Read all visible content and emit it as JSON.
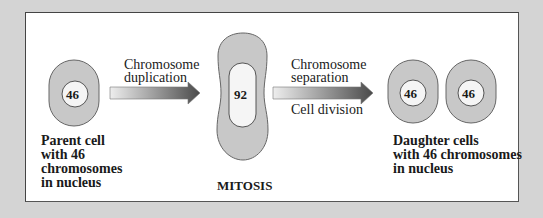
{
  "diagram": {
    "title": "MITOSIS",
    "parent_cell": {
      "chromosome_count": "46",
      "caption": [
        "Parent cell",
        "with 46",
        "chromosomes",
        "in nucleus"
      ]
    },
    "step1": {
      "label": [
        "Chromosome",
        "duplication"
      ]
    },
    "mitosis_cell": {
      "chromosome_count": "92",
      "label": "MITOSIS"
    },
    "step2": {
      "label_above": [
        "Chromosome",
        "separation"
      ],
      "label_below": "Cell division"
    },
    "daughter_cells": {
      "left_count": "46",
      "right_count": "46",
      "caption": [
        "Daughter cells",
        "with 46 chromosomes",
        "in nucleus"
      ]
    },
    "colors": {
      "background": "#d4d4d4",
      "panel": "#ffffff",
      "cell_fill": "#c8c8c8",
      "nucleus_fill": "#f5f5f5",
      "arrow_start": "#e8e8e8",
      "arrow_end": "#555555"
    }
  }
}
